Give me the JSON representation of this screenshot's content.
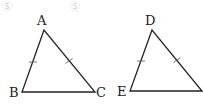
{
  "watermarks": [
    "Ⓢ",
    "Ⓢ"
  ],
  "triangles": [
    {
      "name": "ABC",
      "vertices": {
        "top": "A",
        "left": "B",
        "right": "C"
      },
      "equal_sides_marked": [
        "AB",
        "AC"
      ]
    },
    {
      "name": "DEF",
      "vertices": {
        "top": "D",
        "left": "E",
        "right": ""
      },
      "equal_sides_marked": [
        "DE",
        "DF"
      ]
    }
  ],
  "colors": {
    "line": "#222222",
    "label": "#222222",
    "watermark": "#cfcfcf"
  }
}
